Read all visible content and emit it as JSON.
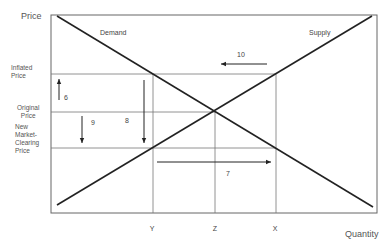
{
  "axes": {
    "y_label": "Price",
    "x_label": "Quantity"
  },
  "curves": {
    "demand_label": "Demand",
    "supply_label": "Supply"
  },
  "price_levels": {
    "inflated": [
      "Inflated",
      "Price"
    ],
    "original": [
      "Original",
      "Price"
    ],
    "new": [
      "New",
      "Market-",
      "Clearing",
      "Price"
    ]
  },
  "quantity_levels": {
    "y": "Y",
    "z": "Z",
    "x": "X"
  },
  "arrows": {
    "a6": "6",
    "a7": "7",
    "a8": "8",
    "a9": "9",
    "a10": "10"
  },
  "colors": {
    "line": "#222222",
    "grid": "#777777",
    "frame": "#666666"
  }
}
